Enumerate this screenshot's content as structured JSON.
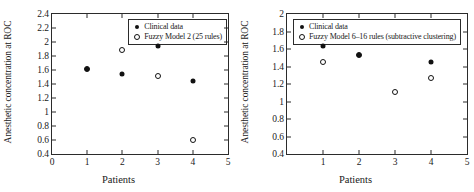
{
  "chart_data": [
    {
      "panel": "left",
      "type": "scatter",
      "title": "",
      "xlabel": "Patients",
      "ylabel": "Anesthetic concentration at ROC",
      "xlim": [
        0,
        5
      ],
      "ylim": [
        0.4,
        2.4
      ],
      "xticks": [
        "0",
        "1",
        "2",
        "3",
        "4",
        "5"
      ],
      "xtick_values": [
        0,
        1,
        2,
        3,
        4,
        5
      ],
      "yticks": [
        "0.4",
        "0.6",
        "0.8",
        "1",
        "1.2",
        "1.4",
        "1.6",
        "1.8",
        "2",
        "2.2",
        "2.4"
      ],
      "ytick_values": [
        0.4,
        0.6,
        0.8,
        1.0,
        1.2,
        1.4,
        1.6,
        1.8,
        2.0,
        2.2,
        2.4
      ],
      "grid": false,
      "legend_position": "top-right",
      "x": [
        1,
        2,
        3,
        4
      ],
      "series": [
        {
          "name": "Clinical data",
          "marker": "filled-circle",
          "color": "#111111",
          "values": [
            1.62,
            1.54,
            1.94,
            1.45
          ]
        },
        {
          "name": "Fuzzy Model 2 (25 rules)",
          "marker": "hollow-circle",
          "color": "#111111",
          "values": [
            1.62,
            1.89,
            1.51,
            0.6
          ]
        }
      ]
    },
    {
      "panel": "right",
      "type": "scatter",
      "title": "",
      "xlabel": "Patients",
      "ylabel": "Anesthetic concentration at ROC",
      "xlim": [
        0,
        5
      ],
      "ylim": [
        0.4,
        2.0
      ],
      "xticks": [
        "1",
        "2",
        "3",
        "4",
        "5"
      ],
      "xtick_values": [
        1,
        2,
        3,
        4,
        5
      ],
      "yticks": [
        "0.4",
        "0.6",
        "0.8",
        "1",
        "1.2",
        "1.4",
        "1.6",
        "1.8",
        "2"
      ],
      "ytick_values": [
        0.4,
        0.6,
        0.8,
        1.0,
        1.2,
        1.4,
        1.6,
        1.8,
        2.0
      ],
      "grid": false,
      "legend_position": "top-left",
      "x": [
        1,
        2,
        3,
        4
      ],
      "series": [
        {
          "name": "Clinical data",
          "marker": "filled-circle",
          "color": "#111111",
          "values": [
            1.63,
            1.53,
            null,
            1.45
          ]
        },
        {
          "name": "Fuzzy Model 6–16 rules (subtractive clustering)",
          "marker": "hollow-circle",
          "color": "#111111",
          "values": [
            1.45,
            1.53,
            1.11,
            1.27
          ]
        }
      ]
    }
  ]
}
